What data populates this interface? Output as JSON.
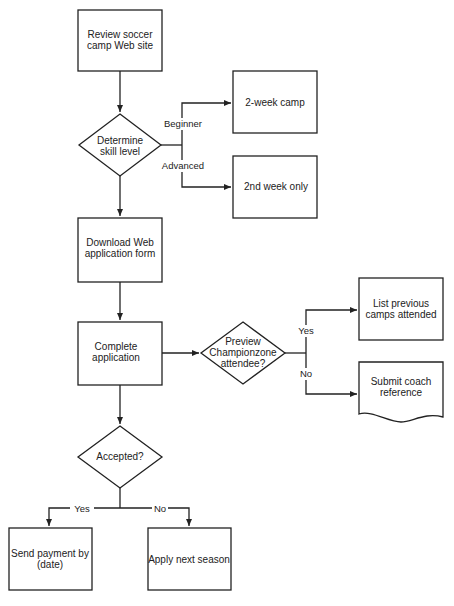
{
  "diagram": {
    "type": "flowchart",
    "nodes": {
      "review": {
        "shape": "process",
        "line1": "Review soccer",
        "line2": "camp Web site"
      },
      "skill": {
        "shape": "decision",
        "line1": "Determine",
        "line2": "skill level"
      },
      "two_week": {
        "shape": "process",
        "line1": "2-week camp"
      },
      "second_week": {
        "shape": "process",
        "line1": "2nd week only"
      },
      "download": {
        "shape": "process",
        "line1": "Download Web",
        "line2": "application form"
      },
      "complete": {
        "shape": "process",
        "line1": "Complete",
        "line2": "application"
      },
      "preview": {
        "shape": "decision",
        "line1": "Preview",
        "line2": "Championzone",
        "line3": "attendee?"
      },
      "list_prev": {
        "shape": "process",
        "line1": "List previous",
        "line2": "camps attended"
      },
      "coach_ref": {
        "shape": "document",
        "line1": "Submit coach",
        "line2": "reference"
      },
      "accepted": {
        "shape": "decision",
        "line1": "Accepted?"
      },
      "payment": {
        "shape": "process",
        "line1": "Send payment by",
        "line2": "(date)"
      },
      "next_season": {
        "shape": "process",
        "line1": "Apply next season"
      }
    },
    "edge_labels": {
      "beginner": "Beginner",
      "advanced": "Advanced",
      "preview_yes": "Yes",
      "preview_no": "No",
      "accepted_yes": "Yes",
      "accepted_no": "No"
    },
    "edges": [
      {
        "from": "review",
        "to": "skill"
      },
      {
        "from": "skill",
        "to": "two_week",
        "label": "Beginner"
      },
      {
        "from": "skill",
        "to": "second_week",
        "label": "Advanced"
      },
      {
        "from": "skill",
        "to": "download"
      },
      {
        "from": "download",
        "to": "complete"
      },
      {
        "from": "complete",
        "to": "preview"
      },
      {
        "from": "preview",
        "to": "list_prev",
        "label": "Yes"
      },
      {
        "from": "preview",
        "to": "coach_ref",
        "label": "No"
      },
      {
        "from": "complete",
        "to": "accepted"
      },
      {
        "from": "accepted",
        "to": "payment",
        "label": "Yes"
      },
      {
        "from": "accepted",
        "to": "next_season",
        "label": "No"
      }
    ],
    "colors": {
      "stroke": "#222222",
      "background": "#ffffff"
    }
  }
}
